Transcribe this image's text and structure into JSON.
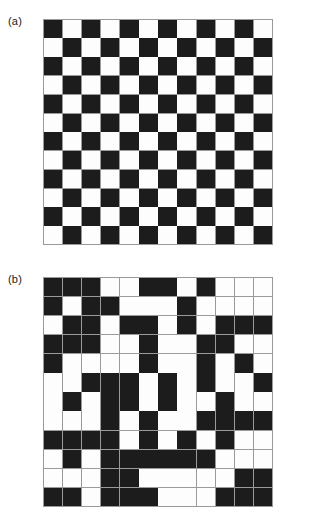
{
  "figure": {
    "kind": "two-panel-binary-grid-figure",
    "background_color": "#ffffff",
    "panels": [
      {
        "id": "a",
        "label": "(a)",
        "description": "regular checkerboard pattern",
        "rows": 12,
        "cols": 12,
        "black_color": "#1c1c1c",
        "white_color": "#fdfdfd",
        "gridline_color": "#9a9a9a",
        "cells": [
          [
            1,
            0,
            1,
            0,
            1,
            0,
            1,
            0,
            1,
            0,
            1,
            0
          ],
          [
            0,
            1,
            0,
            1,
            0,
            1,
            0,
            1,
            0,
            1,
            0,
            1
          ],
          [
            1,
            0,
            1,
            0,
            1,
            0,
            1,
            0,
            1,
            0,
            1,
            0
          ],
          [
            0,
            1,
            0,
            1,
            0,
            1,
            0,
            1,
            0,
            1,
            0,
            1
          ],
          [
            1,
            0,
            1,
            0,
            1,
            0,
            1,
            0,
            1,
            0,
            1,
            0
          ],
          [
            0,
            1,
            0,
            1,
            0,
            1,
            0,
            1,
            0,
            1,
            0,
            1
          ],
          [
            1,
            0,
            1,
            0,
            1,
            0,
            1,
            0,
            1,
            0,
            1,
            0
          ],
          [
            0,
            1,
            0,
            1,
            0,
            1,
            0,
            1,
            0,
            1,
            0,
            1
          ],
          [
            1,
            0,
            1,
            0,
            1,
            0,
            1,
            0,
            1,
            0,
            1,
            0
          ],
          [
            0,
            1,
            0,
            1,
            0,
            1,
            0,
            1,
            0,
            1,
            0,
            1
          ],
          [
            1,
            0,
            1,
            0,
            1,
            0,
            1,
            0,
            1,
            0,
            1,
            0
          ],
          [
            0,
            1,
            0,
            1,
            0,
            1,
            0,
            1,
            0,
            1,
            0,
            1
          ]
        ]
      },
      {
        "id": "b",
        "label": "(b)",
        "description": "random binary pattern",
        "rows": 12,
        "cols": 12,
        "black_color": "#1c1c1c",
        "white_color": "#fdfdfd",
        "gridline_color": "#9a9a9a",
        "cells": [
          [
            1,
            1,
            1,
            0,
            0,
            1,
            1,
            0,
            1,
            0,
            0,
            0
          ],
          [
            1,
            0,
            1,
            1,
            0,
            0,
            0,
            1,
            0,
            0,
            0,
            0
          ],
          [
            0,
            1,
            1,
            0,
            1,
            1,
            0,
            1,
            0,
            1,
            1,
            1
          ],
          [
            1,
            1,
            1,
            0,
            0,
            1,
            0,
            0,
            1,
            1,
            0,
            0
          ],
          [
            1,
            0,
            0,
            0,
            0,
            1,
            0,
            0,
            1,
            0,
            1,
            0
          ],
          [
            0,
            0,
            1,
            1,
            1,
            0,
            1,
            0,
            1,
            0,
            0,
            1
          ],
          [
            0,
            1,
            0,
            1,
            1,
            0,
            1,
            0,
            0,
            1,
            0,
            0
          ],
          [
            0,
            0,
            0,
            1,
            0,
            1,
            0,
            0,
            1,
            1,
            1,
            1
          ],
          [
            1,
            1,
            1,
            1,
            0,
            1,
            0,
            1,
            0,
            1,
            0,
            0
          ],
          [
            0,
            1,
            0,
            1,
            1,
            1,
            1,
            1,
            1,
            0,
            0,
            0
          ],
          [
            0,
            0,
            0,
            1,
            1,
            0,
            0,
            0,
            0,
            0,
            1,
            1
          ],
          [
            1,
            1,
            0,
            1,
            1,
            1,
            0,
            0,
            0,
            1,
            1,
            1
          ]
        ]
      }
    ]
  }
}
